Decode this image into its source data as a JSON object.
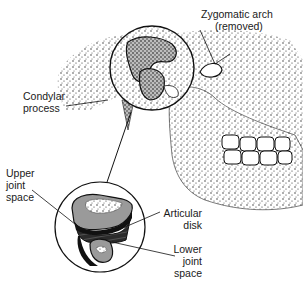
{
  "figure": {
    "labels": {
      "zygomatic_arch": [
        "Zygomatic arch",
        "(removed)"
      ],
      "condylar_process": [
        "Condylar",
        "process"
      ],
      "upper_joint_space": [
        "Upper",
        "joint",
        "space"
      ],
      "articular_disk": [
        "Articular",
        "disk"
      ],
      "lower_joint_space": [
        "Lower",
        "joint",
        "space"
      ]
    }
  },
  "colors": {
    "ink": "#111111",
    "stipple": "#2a2a2a",
    "bone_gray": "#9a9a9a",
    "disk_dark": "#2b2b2b",
    "background": "#ffffff"
  }
}
